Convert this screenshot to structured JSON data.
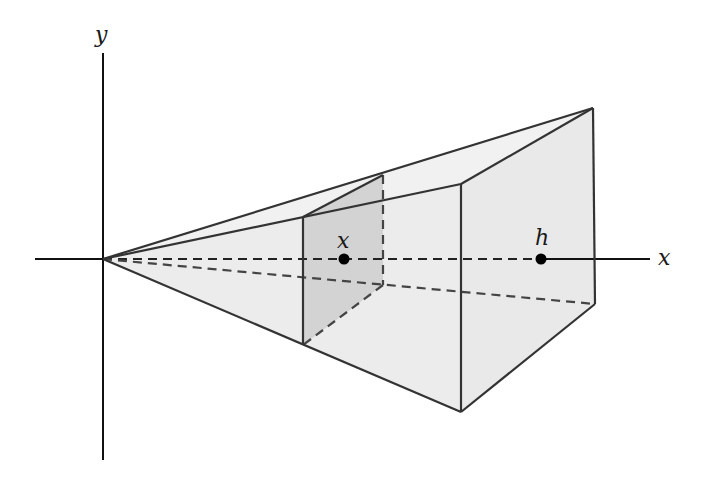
{
  "diagram": {
    "labels": {
      "y_axis": "y",
      "x_axis": "x",
      "slice_point": "x",
      "base_point": "h"
    },
    "colors": {
      "solid_fill": "#ececec",
      "slice_fill": "#d2d2d2",
      "edge": "#333333",
      "axis": "#111111"
    }
  }
}
